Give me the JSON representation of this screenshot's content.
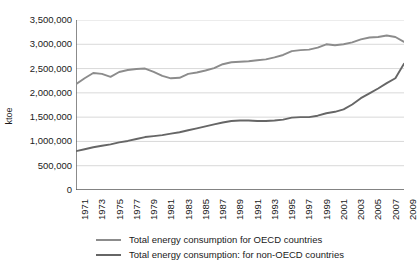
{
  "chart_data": {
    "type": "line",
    "title": "",
    "xlabel": "",
    "ylabel": "ktoe",
    "ylim": [
      0,
      3500000
    ],
    "grid": true,
    "legend_position": "bottom",
    "x": [
      1971,
      1972,
      1973,
      1974,
      1975,
      1976,
      1977,
      1978,
      1979,
      1980,
      1981,
      1982,
      1983,
      1984,
      1985,
      1986,
      1987,
      1988,
      1989,
      1990,
      1991,
      1992,
      1993,
      1994,
      1995,
      1996,
      1997,
      1998,
      1999,
      2000,
      2001,
      2002,
      2003,
      2004,
      2005,
      2006,
      2007,
      2008,
      2009
    ],
    "y_tick_labels": [
      "0",
      "500,000",
      "1,000,000",
      "1,500,000",
      "2,000,000",
      "2,500,000",
      "3,000,000",
      "3,500,000"
    ],
    "y_tick_values": [
      0,
      500000,
      1000000,
      1500000,
      2000000,
      2500000,
      3000000,
      3500000
    ],
    "x_tick_labels": [
      "1971",
      "1973",
      "1975",
      "1977",
      "1979",
      "1981",
      "1983",
      "1985",
      "1987",
      "1989",
      "1991",
      "1993",
      "1995",
      "1997",
      "1999",
      "2001",
      "2003",
      "2005",
      "2007",
      "2009"
    ],
    "series": [
      {
        "name": "Total energy consumption for OECD countries",
        "color": "#8c8c8c",
        "values": [
          2180000,
          2300000,
          2410000,
          2390000,
          2330000,
          2430000,
          2470000,
          2490000,
          2500000,
          2430000,
          2350000,
          2300000,
          2310000,
          2390000,
          2420000,
          2460000,
          2510000,
          2590000,
          2630000,
          2640000,
          2650000,
          2670000,
          2690000,
          2730000,
          2780000,
          2860000,
          2880000,
          2890000,
          2930000,
          3000000,
          2980000,
          3000000,
          3040000,
          3100000,
          3140000,
          3150000,
          3180000,
          3150000,
          3050000
        ]
      },
      {
        "name": "Total energy consumption: for non-OECD countries",
        "color": "#666666",
        "values": [
          800000,
          840000,
          880000,
          910000,
          940000,
          980000,
          1010000,
          1050000,
          1090000,
          1110000,
          1130000,
          1160000,
          1190000,
          1230000,
          1270000,
          1310000,
          1350000,
          1390000,
          1420000,
          1430000,
          1430000,
          1420000,
          1420000,
          1430000,
          1450000,
          1490000,
          1500000,
          1500000,
          1530000,
          1580000,
          1610000,
          1660000,
          1760000,
          1890000,
          1990000,
          2090000,
          2200000,
          2300000,
          2600000
        ]
      }
    ]
  },
  "legend": {
    "items": [
      {
        "label": "Total energy consumption for OECD countries"
      },
      {
        "label": "Total energy consumption: for non-OECD countries"
      }
    ]
  },
  "colors": {
    "series_oecd": "#8c8c8c",
    "series_non_oecd": "#666666",
    "axis": "#5a5a5a",
    "grid": "#d9d9d9",
    "text": "#1a1a1a"
  }
}
